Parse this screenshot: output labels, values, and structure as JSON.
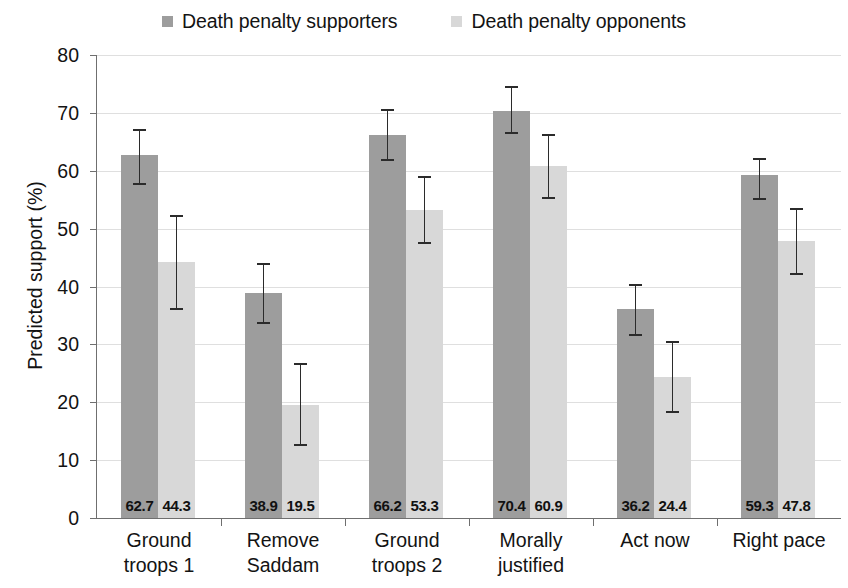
{
  "chart_data": {
    "type": "bar",
    "title": "",
    "xlabel": "",
    "ylabel": "Predicted support (%)",
    "ylim": [
      0,
      80
    ],
    "yticks": [
      0,
      10,
      20,
      30,
      40,
      50,
      60,
      70,
      80
    ],
    "grid": true,
    "legend_position": "top-center",
    "error_bars": "95% confidence intervals",
    "categories": [
      "Ground troops 1",
      "Remove Saddam",
      "Ground troops 2",
      "Morally justified",
      "Act now",
      "Right pace"
    ],
    "category_lines": [
      [
        "Ground",
        "troops 1"
      ],
      [
        "Remove",
        "Saddam"
      ],
      [
        "Ground",
        "troops 2"
      ],
      [
        "Morally",
        "justified"
      ],
      [
        "Act now",
        ""
      ],
      [
        "Right pace",
        ""
      ]
    ],
    "series": [
      {
        "name": "Death penalty supporters",
        "color": "#9d9d9d",
        "values": [
          62.7,
          38.9,
          66.2,
          70.4,
          36.2,
          59.3
        ],
        "err_low": [
          57.6,
          33.6,
          61.7,
          66.3,
          31.5,
          55.0
        ],
        "err_high": [
          67.3,
          44.1,
          70.6,
          74.7,
          40.5,
          62.2
        ]
      },
      {
        "name": "Death penalty opponents",
        "color": "#d8d8d8",
        "values": [
          44.3,
          19.5,
          53.3,
          60.9,
          24.4,
          47.8
        ],
        "err_low": [
          35.9,
          12.5,
          47.3,
          55.1,
          18.2,
          42.0
        ],
        "err_high": [
          52.4,
          26.7,
          59.1,
          66.4,
          30.6,
          53.5
        ]
      }
    ]
  },
  "legend": {
    "items": [
      {
        "label": "Death penalty supporters",
        "color": "#9d9d9d"
      },
      {
        "label": "Death penalty opponents",
        "color": "#d8d8d8"
      }
    ]
  },
  "axis": {
    "y_title": "Predicted support (%)",
    "y_tick_labels": [
      "80",
      "70",
      "60",
      "50",
      "40",
      "30",
      "20",
      "10",
      "0"
    ]
  }
}
